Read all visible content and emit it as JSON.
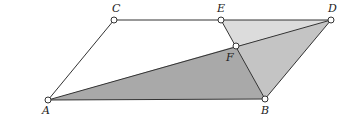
{
  "diagram": {
    "type": "geometry",
    "points": {
      "A": {
        "label": "A",
        "x": 48,
        "y": 100
      },
      "B": {
        "label": "B",
        "x": 265,
        "y": 99
      },
      "C": {
        "label": "C",
        "x": 114,
        "y": 20
      },
      "D": {
        "label": "D",
        "x": 331,
        "y": 20
      },
      "E": {
        "label": "E",
        "x": 221,
        "y": 20
      },
      "F": {
        "label": "F",
        "x": 236,
        "y": 46
      }
    },
    "regions": [
      {
        "name": "triangle-ABF",
        "vertices": [
          "A",
          "B",
          "F"
        ],
        "fill": "#a9a9a9"
      },
      {
        "name": "triangle-BDF",
        "vertices": [
          "B",
          "D",
          "F"
        ],
        "fill": "#c4c4c4"
      },
      {
        "name": "triangle-EFD",
        "vertices": [
          "E",
          "F",
          "D"
        ],
        "fill": "#dcdcdc"
      }
    ],
    "segments": [
      [
        "A",
        "C"
      ],
      [
        "C",
        "D"
      ],
      [
        "D",
        "B"
      ],
      [
        "B",
        "A"
      ],
      [
        "A",
        "D"
      ],
      [
        "E",
        "B"
      ]
    ],
    "colors": {
      "stroke": "#333333",
      "point_fill": "#ffffff"
    }
  }
}
